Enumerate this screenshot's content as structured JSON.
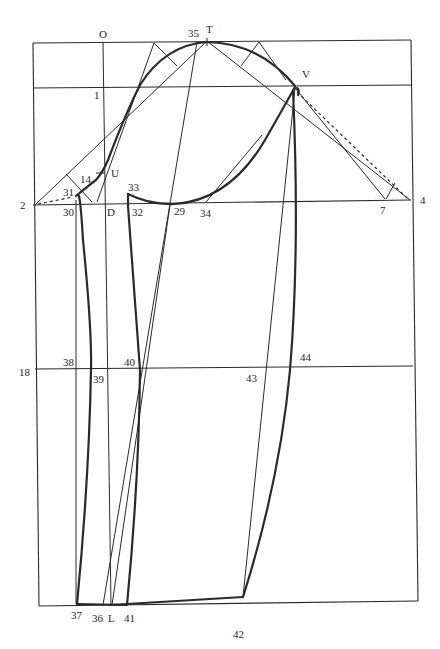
{
  "diagram": {
    "type": "sleeve-pattern-draft",
    "background": "#ffffff",
    "ink_color": "#2a2a2a",
    "labels": {
      "O": "O",
      "T": "T",
      "p35": "35",
      "V": "V",
      "p1": "1",
      "U": "U",
      "p14": "14",
      "p31": "31",
      "p33": "33",
      "p2": "2",
      "p30": "30",
      "D": "D",
      "p32": "32",
      "p29": "29",
      "p34": "34",
      "p7": "7",
      "p4": "4",
      "p18": "18",
      "p38": "38",
      "p39": "39",
      "p40": "40",
      "p43": "43",
      "p44": "44",
      "p37": "37",
      "p36": "36",
      "L": "L",
      "p41": "41",
      "p42": "42"
    }
  }
}
